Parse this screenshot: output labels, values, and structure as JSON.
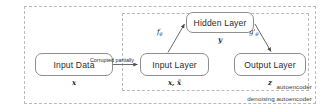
{
  "diagram": {
    "title": "denoising autoencoder",
    "frames": [
      {
        "name": "autoencoder",
        "label": "autoencoder"
      },
      {
        "name": "denoising-autoencoder",
        "label": "denoising autoencoder"
      }
    ],
    "nodes": [
      {
        "id": "input-data",
        "label": "Input Data",
        "sublabel": "x"
      },
      {
        "id": "input-layer",
        "label": "Input Layer",
        "sublabel": "x, x̃"
      },
      {
        "id": "hidden-layer",
        "label": "Hidden Layer",
        "sublabel": "y"
      },
      {
        "id": "output-layer",
        "label": "Output Layer",
        "sublabel": "z"
      }
    ],
    "edges": [
      {
        "from": "input-data",
        "to": "input-layer",
        "label": "Corrupted partially"
      },
      {
        "from": "input-layer",
        "to": "hidden-layer",
        "label": "f",
        "label_sub": "θ"
      },
      {
        "from": "hidden-layer",
        "to": "output-layer",
        "label": "g'",
        "label_sub": "θ"
      }
    ],
    "colors": {
      "box_border": "#8f8f8f",
      "frame_border": "#b9b9b9",
      "text": "#2b2b2b",
      "arrow": "#5a5a5a",
      "background": "#ffffff"
    }
  }
}
